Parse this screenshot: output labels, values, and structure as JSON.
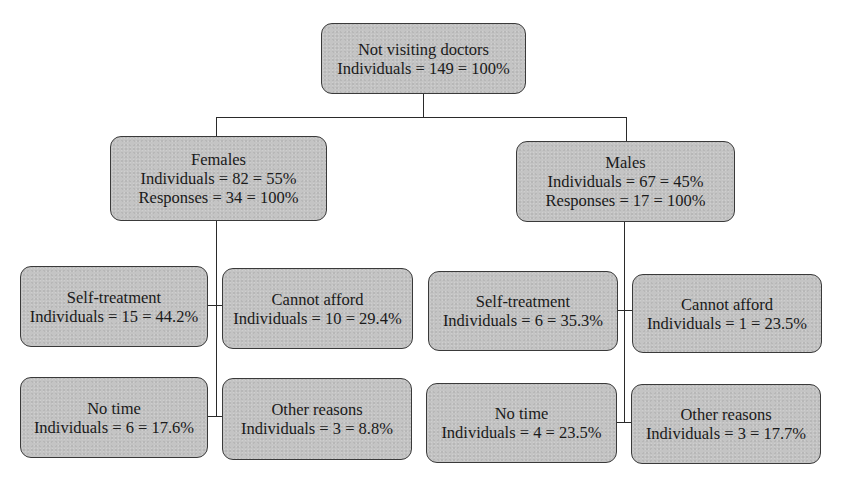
{
  "diagram": {
    "type": "tree",
    "root": {
      "title": "Not visiting doctors",
      "line1": "Individuals = 149 = 100%"
    },
    "females": {
      "title": "Females",
      "line1": "Individuals = 82 = 55%",
      "line2": "Responses = 34 = 100%",
      "children": [
        {
          "title": "Self-treatment",
          "line1": "Individuals = 15 = 44.2%"
        },
        {
          "title": "Cannot afford",
          "line1": "Individuals = 10 = 29.4%"
        },
        {
          "title": "No time",
          "line1": "Individuals = 6 = 17.6%"
        },
        {
          "title": "Other reasons",
          "line1": "Individuals = 3 = 8.8%"
        }
      ]
    },
    "males": {
      "title": "Males",
      "line1": "Individuals = 67 = 45%",
      "line2": "Responses = 17 = 100%",
      "children": [
        {
          "title": "Self-treatment",
          "line1": "Individuals = 6 = 35.3%"
        },
        {
          "title": "Cannot afford",
          "line1": "Individuals = 1 = 23.5%"
        },
        {
          "title": "No time",
          "line1": "Individuals = 4 = 23.5%"
        },
        {
          "title": "Other reasons",
          "line1": "Individuals = 3 = 17.7%"
        }
      ]
    }
  },
  "colors": {
    "box_fill": "#c4c4c4",
    "box_border": "#3a3a3a",
    "line": "#2a2a2a",
    "background": "#ffffff"
  }
}
